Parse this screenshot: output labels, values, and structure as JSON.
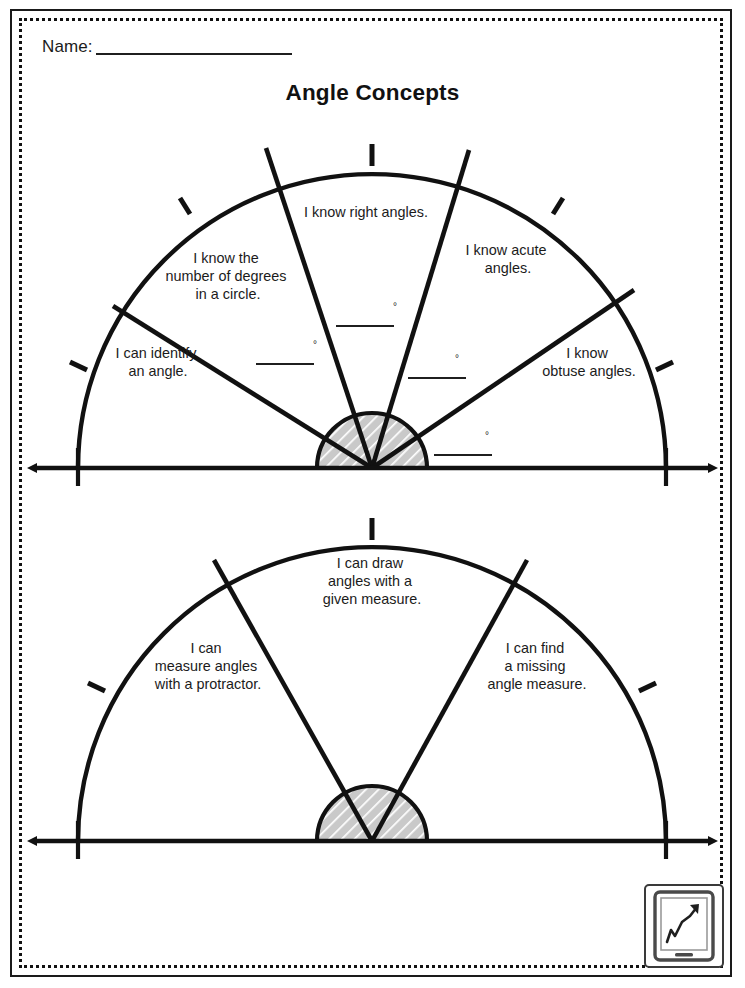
{
  "worksheet": {
    "name_label": "Name:",
    "title": "Angle Concepts",
    "degree_symbol": "°"
  },
  "top_protractor": {
    "sectors": [
      {
        "id": "identify-angle",
        "label_lines": [
          "I can identify",
          "an angle."
        ]
      },
      {
        "id": "degrees-in-circle",
        "label_lines": [
          "I know the",
          "number of degrees",
          "in a circle."
        ]
      },
      {
        "id": "right-angles",
        "label_lines": [
          "I know right angles."
        ]
      },
      {
        "id": "acute-angles",
        "label_lines": [
          "I know acute",
          "angles."
        ]
      },
      {
        "id": "obtuse-angles",
        "label_lines": [
          "I know",
          "obtuse angles."
        ]
      }
    ],
    "answer_blanks": [
      {
        "id": "blank-1",
        "value": ""
      },
      {
        "id": "blank-2",
        "value": ""
      },
      {
        "id": "blank-3",
        "value": ""
      },
      {
        "id": "blank-4",
        "value": ""
      }
    ]
  },
  "bottom_protractor": {
    "sectors": [
      {
        "id": "measure-with-protractor",
        "label_lines": [
          "I can",
          "measure angles",
          "with a protractor."
        ]
      },
      {
        "id": "draw-given-measure",
        "label_lines": [
          "I can draw",
          "angles with a",
          "given measure."
        ]
      },
      {
        "id": "find-missing-measure",
        "label_lines": [
          "I can find",
          "a missing",
          "angle measure."
        ]
      }
    ]
  },
  "badge": {
    "icon": "tablet-growth-chart-icon"
  },
  "colors": {
    "ink": "#111111",
    "hub_fill": "#c9c9c9",
    "page": "#ffffff"
  }
}
